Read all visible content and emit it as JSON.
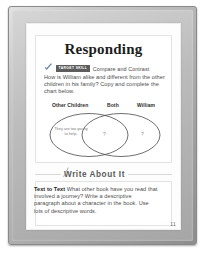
{
  "device": {
    "name": "e-reader-device",
    "bezel_color": "#b4b4b4"
  },
  "page": {
    "heading": "Responding",
    "page_number": "11",
    "skill": {
      "check_icon": "check-icon",
      "badge_label": "TARGET SKILL",
      "skill_name": "Compare and Contrast",
      "badge_color": "#5d5d5d"
    },
    "prompt_text": "How is William alike and different from the other children in his family? Copy and complete the chart below.",
    "venn": {
      "labels": {
        "left": "Other Children",
        "middle": "Both",
        "right": "William"
      },
      "left_note": "They are too young to help.",
      "middle_note": "?",
      "right_note": "?"
    },
    "write_about": {
      "title": "Write About It",
      "pencil_icon": "pencil-icon",
      "lead_in": "Text to Text",
      "body": " What other book have you read that involved a journey? Write a descriptive paragraph about a character in the book. Use lots of descriptive words."
    }
  }
}
